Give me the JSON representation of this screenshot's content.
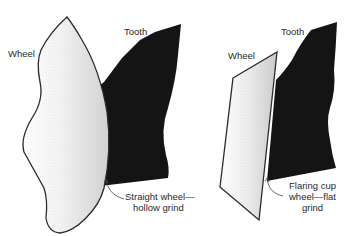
{
  "diagram": {
    "left_panel": {
      "wheel_label": "Wheel",
      "tooth_label": "Tooth",
      "callout_line1": "Straight wheel—",
      "callout_line2": "hollow grind"
    },
    "right_panel": {
      "wheel_label": "Wheel",
      "tooth_label": "Tooth",
      "callout_line1": "Flaring cup",
      "callout_line2": "wheel—flat",
      "callout_line3": "grind"
    },
    "colors": {
      "tooth_fill": "#141414",
      "outline": "#2a2a2a",
      "wheel_stipple": "#cfcfcf"
    }
  }
}
